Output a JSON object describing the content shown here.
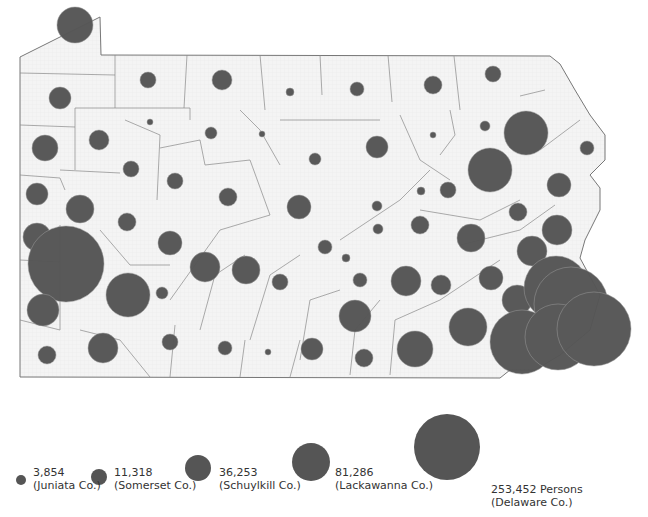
{
  "chart_data": {
    "type": "proportional-symbol-map",
    "title": "",
    "region": "Pennsylvania counties",
    "symbol_color": "#555555",
    "fill_color": "#f2f2f2",
    "border_color": "#777777",
    "legend": [
      {
        "value": "3,854",
        "county": "(Juniata Co.)",
        "r": 5
      },
      {
        "value": "11,318",
        "county": "(Somerset Co.)",
        "r": 8
      },
      {
        "value": "36,253",
        "county": "(Schuylkill Co.)",
        "r": 13
      },
      {
        "value": "81,286",
        "county": "(Lackawanna Co.)",
        "r": 19
      },
      {
        "value": "253,452 Persons",
        "county": "(Delaware Co.)",
        "r": 33
      }
    ],
    "circles": [
      [
        75,
        25,
        18
      ],
      [
        60,
        98,
        11
      ],
      [
        148,
        80,
        8
      ],
      [
        222,
        80,
        10
      ],
      [
        290,
        92,
        4
      ],
      [
        357,
        89,
        7
      ],
      [
        433,
        85,
        9
      ],
      [
        493,
        74,
        8
      ],
      [
        45,
        148,
        13
      ],
      [
        99,
        140,
        10
      ],
      [
        150,
        122,
        3
      ],
      [
        211,
        133,
        6
      ],
      [
        262,
        134,
        3
      ],
      [
        315,
        159,
        6
      ],
      [
        377,
        147,
        11
      ],
      [
        433,
        135,
        3
      ],
      [
        485,
        126,
        5
      ],
      [
        526,
        133,
        22
      ],
      [
        131,
        169,
        8
      ],
      [
        175,
        181,
        8
      ],
      [
        228,
        197,
        9
      ],
      [
        299,
        207,
        12
      ],
      [
        377,
        206,
        5
      ],
      [
        421,
        191,
        4
      ],
      [
        448,
        190,
        8
      ],
      [
        490,
        170,
        22
      ],
      [
        559,
        185,
        12
      ],
      [
        587,
        148,
        7
      ],
      [
        37,
        194,
        11
      ],
      [
        80,
        209,
        14
      ],
      [
        127,
        222,
        9
      ],
      [
        170,
        243,
        12
      ],
      [
        378,
        229,
        5
      ],
      [
        420,
        225,
        9
      ],
      [
        471,
        238,
        14
      ],
      [
        518,
        212,
        9
      ],
      [
        557,
        230,
        15
      ],
      [
        37,
        237,
        14
      ],
      [
        66,
        264,
        38
      ],
      [
        128,
        295,
        22
      ],
      [
        205,
        267,
        15
      ],
      [
        246,
        270,
        14
      ],
      [
        280,
        282,
        8
      ],
      [
        325,
        247,
        7
      ],
      [
        346,
        258,
        4
      ],
      [
        360,
        280,
        7
      ],
      [
        406,
        281,
        15
      ],
      [
        441,
        285,
        10
      ],
      [
        491,
        278,
        12
      ],
      [
        532,
        251,
        15
      ],
      [
        43,
        310,
        16
      ],
      [
        162,
        293,
        6
      ],
      [
        103,
        348,
        15
      ],
      [
        170,
        342,
        8
      ],
      [
        225,
        348,
        7
      ],
      [
        268,
        352,
        3
      ],
      [
        312,
        349,
        11
      ],
      [
        355,
        316,
        16
      ],
      [
        364,
        358,
        9
      ],
      [
        415,
        349,
        18
      ],
      [
        468,
        327,
        19
      ],
      [
        517,
        300,
        15
      ],
      [
        556,
        288,
        32
      ],
      [
        47,
        355,
        9
      ],
      [
        522,
        342,
        32
      ],
      [
        571,
        304,
        37
      ],
      [
        558,
        337,
        33
      ],
      [
        594,
        329,
        37
      ]
    ]
  },
  "legend": {
    "items": [
      {
        "value": "3,854",
        "county": "(Juniata Co.)"
      },
      {
        "value": "11,318",
        "county": "(Somerset Co.)"
      },
      {
        "value": "36,253",
        "county": "(Schuylkill Co.)"
      },
      {
        "value": "81,286",
        "county": "(Lackawanna Co.)"
      },
      {
        "value": "253,452 Persons",
        "county": "(Delaware Co.)"
      }
    ]
  }
}
